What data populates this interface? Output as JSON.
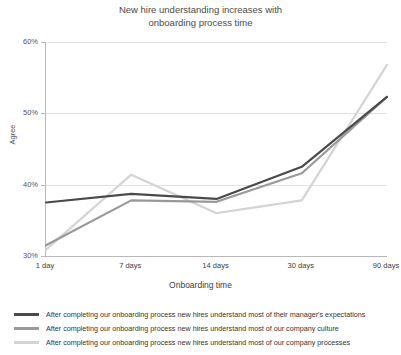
{
  "chart_data": {
    "type": "line",
    "title": "New hire understanding increases with\nonboarding process time",
    "xlabel": "Onboarding time",
    "ylabel": "Agree",
    "categories": [
      "1 day",
      "7 days",
      "14 days",
      "30 days",
      "90 days"
    ],
    "ylim": [
      30,
      60
    ],
    "yticks": [
      "30%",
      "40%",
      "50%",
      "60%"
    ],
    "ytick_values": [
      30,
      40,
      50,
      60
    ],
    "grid": true,
    "legend_position": "bottom",
    "series": [
      {
        "name": "After completing our onboarding process new hires understand most of their manager's expectations",
        "color": "#4a4a4a",
        "values": [
          37.5,
          38.7,
          38.0,
          42.5,
          52.3
        ]
      },
      {
        "name": "After completing our onboarding process new hires understand most of our company culture",
        "color": "#999999",
        "values": [
          31.5,
          37.8,
          37.6,
          41.6,
          52.3
        ]
      },
      {
        "name": "After completing our onboarding process new hires understand most of our company processes",
        "color": "#d4d4d4",
        "values": [
          30.9,
          41.4,
          36.0,
          37.8,
          56.8
        ]
      }
    ]
  }
}
